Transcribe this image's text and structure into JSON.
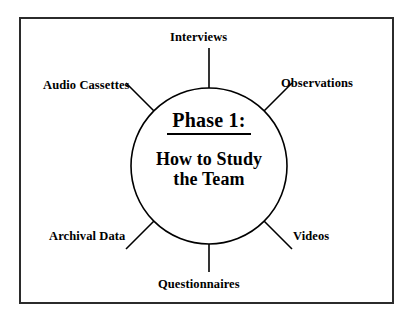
{
  "diagram": {
    "type": "hub-and-spoke",
    "title_lines": {
      "phase": "Phase 1:",
      "subtitle_line1": "How to Study",
      "subtitle_line2": "the Team"
    },
    "center": {
      "shape": "circle",
      "cx": 209,
      "cy": 166,
      "r": 78,
      "stroke": "#000000",
      "fill": "#ffffff"
    },
    "frame": {
      "stroke": "#2b2b2b",
      "fill": "#ffffff"
    },
    "spokes": [
      {
        "label": "Interviews",
        "angle_deg": 90,
        "position": "top",
        "x1": 209,
        "y1": 88,
        "x2": 209,
        "y2": 48
      },
      {
        "label": "Observations",
        "angle_deg": 45,
        "position": "top-right",
        "x1": 264,
        "y1": 111,
        "x2": 292,
        "y2": 83
      },
      {
        "label": "Audio Cassettes",
        "angle_deg": 135,
        "position": "top-left",
        "x1": 154,
        "y1": 111,
        "x2": 126,
        "y2": 83
      },
      {
        "label": "Archival Data",
        "angle_deg": 225,
        "position": "bottom-left",
        "x1": 154,
        "y1": 221,
        "x2": 126,
        "y2": 249
      },
      {
        "label": "Videos",
        "angle_deg": 315,
        "position": "bottom-right",
        "x1": 264,
        "y1": 221,
        "x2": 292,
        "y2": 249
      },
      {
        "label": "Questionnaires",
        "angle_deg": 270,
        "position": "bottom",
        "x1": 209,
        "y1": 244,
        "x2": 209,
        "y2": 272
      }
    ]
  }
}
